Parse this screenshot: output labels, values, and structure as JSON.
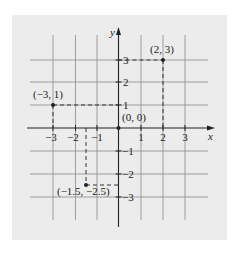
{
  "figure": {
    "background_color": "#ececec",
    "grid_color": "#8a8a8a",
    "axis_color": "#222222",
    "axes": {
      "x_label": "x",
      "y_label": "y",
      "x_ticks": [
        {
          "value": -3,
          "label": "−3"
        },
        {
          "value": -2,
          "label": "−2"
        },
        {
          "value": -1,
          "label": "−1"
        },
        {
          "value": 1,
          "label": "1"
        },
        {
          "value": 2,
          "label": "2"
        },
        {
          "value": 3,
          "label": "3"
        }
      ],
      "y_ticks": [
        {
          "value": 3,
          "label": "3"
        },
        {
          "value": 2,
          "label": "2"
        },
        {
          "value": 1,
          "label": "1"
        },
        {
          "value": -1,
          "label": "−1"
        },
        {
          "value": -2,
          "label": "−2"
        },
        {
          "value": -3,
          "label": "−3"
        }
      ]
    },
    "points": [
      {
        "x": 2,
        "y": 3,
        "label": "(2, 3)"
      },
      {
        "x": -3,
        "y": 1,
        "label": "(−3, 1)"
      },
      {
        "x": 0,
        "y": 0,
        "label": "(0, 0)"
      },
      {
        "x": -1.5,
        "y": -2.5,
        "label": "(−1.5, −2.5)"
      }
    ]
  }
}
